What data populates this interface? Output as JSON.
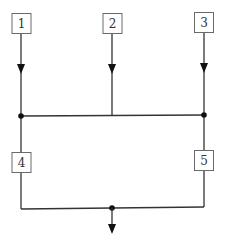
{
  "diagram": {
    "type": "block-network",
    "colors": {
      "line": "#333333",
      "box_border": "#6a6a6a",
      "junction": "#111111",
      "background": "#ffffff"
    },
    "nodes": [
      {
        "id": "1",
        "label": "1"
      },
      {
        "id": "2",
        "label": "2"
      },
      {
        "id": "3",
        "label": "3"
      },
      {
        "id": "4",
        "label": "4"
      },
      {
        "id": "5",
        "label": "5"
      }
    ],
    "edges": [
      {
        "from": "1",
        "to": "upper-bus",
        "arrow": true
      },
      {
        "from": "2",
        "to": "upper-bus",
        "arrow": true
      },
      {
        "from": "3",
        "to": "upper-bus",
        "arrow": true
      },
      {
        "from": "upper-bus-left-junction",
        "to": "4"
      },
      {
        "from": "upper-bus-right-junction",
        "to": "5"
      },
      {
        "from": "4",
        "to": "lower-bus"
      },
      {
        "from": "5",
        "to": "lower-bus"
      },
      {
        "from": "lower-bus-junction",
        "to": "output",
        "arrow": true
      }
    ]
  }
}
